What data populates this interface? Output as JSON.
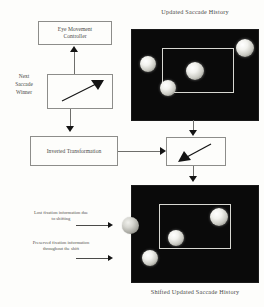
{
  "diagram": {
    "background_color": "#fdfdfb",
    "panel_color": "#0a0a0a",
    "frame_color": "#d8d8d2"
  },
  "labels": {
    "updated_saccade_history": "Updated Saccade History",
    "shifted_updated_saccade_history": "Shifted Updated Saccade History",
    "next_saccade_winner": "Next\nSaccade\nWinner"
  },
  "boxes": {
    "eye_movement_controller": "Eye Movement\nController",
    "saccade_winner_box": "",
    "inverted_transformation": "Inverted Transformation",
    "shift_vector_box": ""
  },
  "notes": {
    "lost_fixation": "Lost fixation information due\nto shifting",
    "preserved_fixation": "Preserved fixation information\nthroughout the shift"
  },
  "panels": {
    "top": {
      "name": "Updated Saccade History",
      "frame": {
        "x": 30,
        "y": 18,
        "w": 72,
        "h": 45
      },
      "blobs": [
        {
          "id": "top-left-outside",
          "x": 8,
          "y": 26,
          "r": 8,
          "inside_frame": false,
          "shade": "white"
        },
        {
          "id": "top-right-outside",
          "x": 104,
          "y": 9,
          "r": 9,
          "inside_frame": false,
          "shade": "white"
        },
        {
          "id": "center-inside",
          "x": 54,
          "y": 32,
          "r": 9,
          "inside_frame": true,
          "shade": "white"
        },
        {
          "id": "lower-left-inside",
          "x": 28,
          "y": 50,
          "r": 8,
          "inside_frame": true,
          "shade": "white"
        }
      ]
    },
    "bottom": {
      "name": "Shifted Updated Saccade History",
      "frame": {
        "x": 27,
        "y": 18,
        "w": 72,
        "h": 45
      },
      "blobs": [
        {
          "id": "upper-right-inside",
          "x": 78,
          "y": 22,
          "r": 9,
          "inside_frame": true,
          "shade": "white"
        },
        {
          "id": "center-left-inside",
          "x": 36,
          "y": 44,
          "r": 8,
          "inside_frame": true,
          "shade": "white"
        },
        {
          "id": "lower-left-outside",
          "x": 10,
          "y": 64,
          "r": 8,
          "inside_frame": false,
          "shade": "white"
        },
        {
          "id": "shifted-out-of-view",
          "x": -12,
          "y": 31,
          "r": 8,
          "inside_frame": false,
          "shade": "grey"
        }
      ]
    }
  },
  "arrows": {
    "winner_to_controller": "up",
    "winner_to_transformation": "down",
    "transformation_to_shift_vector": "right",
    "top_panel_to_shift_vector": "down",
    "shift_vector_to_bottom_panel": "down",
    "note_lost_to_blob": "right",
    "note_preserved_to_blob": "right",
    "inside_winner_box": "up-right",
    "inside_shift_vector_box": "down-left"
  }
}
